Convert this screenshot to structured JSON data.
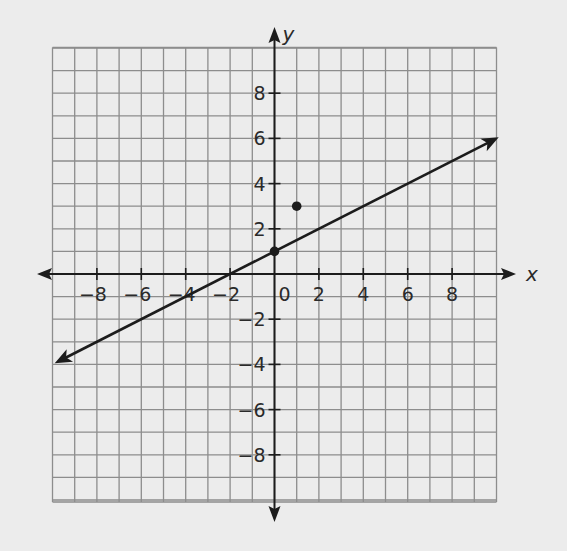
{
  "chart_data": {
    "type": "line",
    "title": "",
    "xlabel": "x",
    "ylabel": "y",
    "xlim": [
      -10,
      10
    ],
    "ylim": [
      -10,
      10
    ],
    "grid": true,
    "grid_step": 1,
    "x_ticks": [
      {
        "value": -8,
        "label": "−8"
      },
      {
        "value": -6,
        "label": "−6"
      },
      {
        "value": -4,
        "label": "−4"
      },
      {
        "value": -2,
        "label": "−2"
      },
      {
        "value": 2,
        "label": "2"
      },
      {
        "value": 4,
        "label": "4"
      },
      {
        "value": 6,
        "label": "6"
      },
      {
        "value": 8,
        "label": "8"
      }
    ],
    "y_ticks": [
      {
        "value": 8,
        "label": "8"
      },
      {
        "value": 6,
        "label": "6"
      },
      {
        "value": 4,
        "label": "4"
      },
      {
        "value": 2,
        "label": "2"
      },
      {
        "value": -2,
        "label": "−2"
      },
      {
        "value": -4,
        "label": "−4"
      },
      {
        "value": -6,
        "label": "−6"
      },
      {
        "value": -8,
        "label": "−8"
      }
    ],
    "origin_label": "0",
    "series": [
      {
        "name": "line",
        "kind": "line-with-arrows",
        "equation": "y = 0.5x + 1",
        "slope": 0.5,
        "intercept": 1,
        "x": [
          -9.9,
          10.1
        ],
        "y": [
          -3.95,
          6.05
        ],
        "color": "#1c1c1c"
      }
    ],
    "points": [
      {
        "name": "y-intercept",
        "x": 0,
        "y": 1
      },
      {
        "name": "point",
        "x": 1,
        "y": 3
      }
    ]
  }
}
